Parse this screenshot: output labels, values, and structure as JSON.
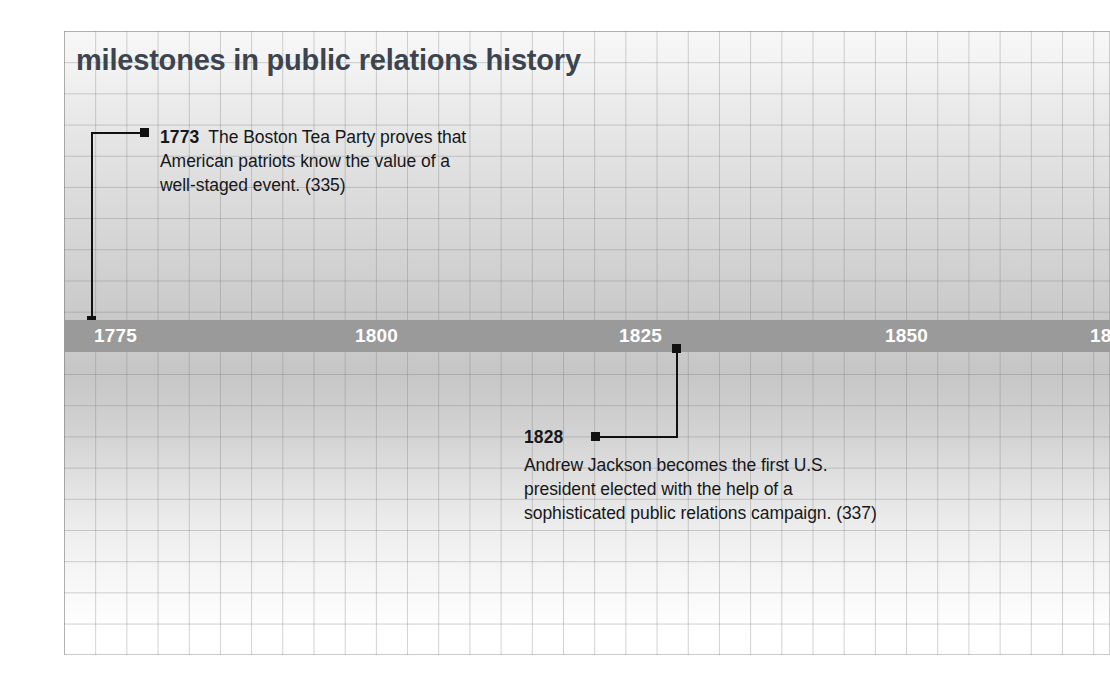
{
  "figure": {
    "title": "milestones in public relations history",
    "colors": {
      "title": "#3c4450",
      "bar": "#9a9a9a",
      "bar_label": "#ffffff",
      "body_text": "#15171a",
      "marker": "#111111",
      "grid_line": "#787878"
    }
  },
  "timeline": {
    "axis": {
      "ticks": [
        {
          "label": "1775",
          "year": 1775,
          "x": 94
        },
        {
          "label": "1800",
          "year": 1800,
          "x": 355
        },
        {
          "label": "1825",
          "year": 1825,
          "x": 619
        },
        {
          "label": "1850",
          "year": 1850,
          "x": 885
        },
        {
          "label": "18",
          "year": 1875,
          "x": 1090,
          "clipped": true
        }
      ],
      "start_year": 1775,
      "end_year": 1875
    },
    "events": [
      {
        "id": "event-1773",
        "year": "1773",
        "text": "The Boston Tea Party proves that American patriots know the value of a well-staged event. (335)",
        "page_reference": "(335)",
        "position": "above",
        "lines": [
          "The Boston Tea Party proves that",
          "American patriots know the value of a",
          "well-staged event. (335)"
        ]
      },
      {
        "id": "event-1828",
        "year": "1828",
        "text": "Andrew Jackson becomes the first U.S. president elected with the help of a sophisticated public relations campaign. (337)",
        "page_reference": "(337)",
        "position": "below",
        "lines": [
          "Andrew Jackson becomes the first U.S.",
          "president elected with the help of a",
          "sophisticated public relations campaign. (337)"
        ]
      }
    ]
  }
}
